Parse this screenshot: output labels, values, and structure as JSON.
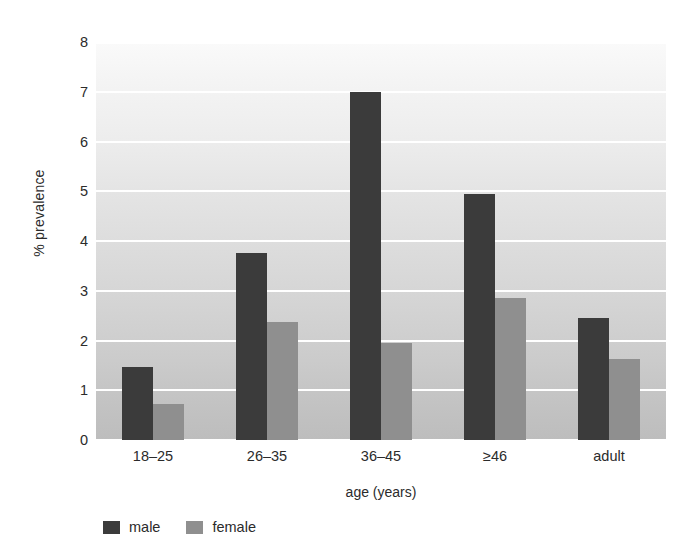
{
  "chart_data": {
    "type": "bar",
    "title": "",
    "xlabel": "age (years)",
    "ylabel": "% prevalence",
    "categories": [
      "18–25",
      "26–35",
      "36–45",
      "≥46",
      "adult"
    ],
    "series": [
      {
        "name": "male",
        "color": "#3b3b3b",
        "values": [
          1.47,
          3.75,
          7.0,
          4.95,
          2.45
        ]
      },
      {
        "name": "female",
        "color": "#8f8f8f",
        "values": [
          0.73,
          2.38,
          1.95,
          2.85,
          1.62
        ]
      }
    ],
    "ylim": [
      0,
      8
    ],
    "ytick_labels": [
      "0",
      "1",
      "2",
      "3",
      "4",
      "5",
      "6",
      "7",
      "8"
    ],
    "ytick_values": [
      0,
      1,
      2,
      3,
      4,
      5,
      6,
      7,
      8
    ],
    "grid": true,
    "grid_color": "#ffffff",
    "grid_axis": "y",
    "legend_position": "bottom-left",
    "plot_background": "vertical gradient light-gray to medium-gray"
  }
}
